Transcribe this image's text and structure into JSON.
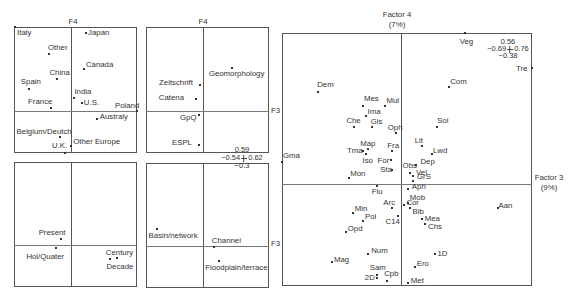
{
  "figure": {
    "f4_label": "F4",
    "f3_label": "F3",
    "factor4_title": "Factor 4",
    "factor4_pct": "(7%)",
    "factor3_title": "Factor 3",
    "factor3_pct": "(9%)",
    "scale_small": {
      "top": "0.59",
      "left": "−0.54",
      "right": "0.62",
      "bottom": "−0.3"
    },
    "scale_large": {
      "top": "0.56",
      "left": "−0.69",
      "right": "0.76",
      "bottom": "−0.38"
    }
  },
  "chart_data": [
    {
      "type": "scatter",
      "xlabel": "F3",
      "ylabel": "F4",
      "xlim": [
        -0.54,
        0.62
      ],
      "ylim": [
        -0.3,
        0.59
      ],
      "grid": false,
      "points": [
        {
          "label": "Italy",
          "x": -0.53,
          "y": 0.59,
          "dx": 2,
          "dy": 6
        },
        {
          "label": "Other",
          "x": -0.21,
          "y": 0.4,
          "dx": -1,
          "dy": -6
        },
        {
          "label": "China",
          "x": -0.13,
          "y": 0.22,
          "dx": -8,
          "dy": -6
        },
        {
          "label": "Spain",
          "x": -0.4,
          "y": 0.15,
          "dx": -8,
          "dy": -7
        },
        {
          "label": "France",
          "x": -0.19,
          "y": 0.02,
          "dx": -23,
          "dy": -6
        },
        {
          "label": "Japan",
          "x": 0.14,
          "y": 0.55,
          "dx": 2,
          "dy": 0
        },
        {
          "label": "Canada",
          "x": 0.12,
          "y": 0.29,
          "dx": 2,
          "dy": -4
        },
        {
          "label": "India",
          "x": 0.03,
          "y": 0.09,
          "dx": 0,
          "dy": -6
        },
        {
          "label": "U.S.",
          "x": 0.1,
          "y": 0.05,
          "dx": 2,
          "dy": 0
        },
        {
          "label": "Poland",
          "x": 0.62,
          "y": 0.0,
          "dx": -22,
          "dy": -5
        },
        {
          "label": "Australy",
          "x": 0.24,
          "y": -0.06,
          "dx": 3,
          "dy": -2
        },
        {
          "label": "Belgium/Deutch",
          "x": -0.11,
          "y": -0.19,
          "dx": -43,
          "dy": -5
        },
        {
          "label": "U.K.",
          "x": -0.06,
          "y": -0.3,
          "dx": -13,
          "dy": -7
        },
        {
          "label": "Other Europe",
          "x": 0.0,
          "y": -0.25,
          "dx": 2,
          "dy": -4
        }
      ]
    },
    {
      "type": "scatter",
      "xlabel": "F3",
      "ylabel": "F4",
      "xlim": [
        -0.54,
        0.62
      ],
      "ylim": [
        -0.3,
        0.59
      ],
      "grid": false,
      "points": [
        {
          "label": "Present",
          "x": -0.1,
          "y": 0.04,
          "dx": -22,
          "dy": -6
        },
        {
          "label": "Hol/Quater",
          "x": -0.14,
          "y": -0.02,
          "dx": -30,
          "dy": 9
        },
        {
          "label": "Century",
          "x": 0.43,
          "y": -0.09,
          "dx": -11,
          "dy": -5
        },
        {
          "label": "Decade",
          "x": 0.37,
          "y": -0.1,
          "dx": -4,
          "dy": 8
        }
      ]
    },
    {
      "type": "scatter",
      "xlabel": "F3",
      "ylabel": "F4",
      "xlim": [
        -0.54,
        0.62
      ],
      "ylim": [
        -0.3,
        0.59
      ],
      "grid": false,
      "points": [
        {
          "label": "Geomorphology",
          "x": 0.27,
          "y": 0.3,
          "dx": -23,
          "dy": 6
        },
        {
          "label": "Zeitschrift",
          "x": -0.03,
          "y": 0.18,
          "dx": -41,
          "dy": -2
        },
        {
          "label": "Catena",
          "x": -0.07,
          "y": 0.08,
          "dx": -37,
          "dy": -1
        },
        {
          "label": "GpQ",
          "x": -0.04,
          "y": -0.03,
          "dx": -19,
          "dy": 3
        },
        {
          "label": "ESPL",
          "x": -0.04,
          "y": -0.24,
          "dx": -27,
          "dy": -2
        }
      ]
    },
    {
      "type": "scatter",
      "xlabel": "F3",
      "ylabel": "F4",
      "xlim": [
        -0.54,
        0.62
      ],
      "ylim": [
        -0.3,
        0.59
      ],
      "grid": false,
      "points": [
        {
          "label": "Basin/network",
          "x": -0.44,
          "y": 0.12,
          "dx": -8,
          "dy": 7
        },
        {
          "label": "Channel",
          "x": 0.1,
          "y": -0.01,
          "dx": -2,
          "dy": -6
        },
        {
          "label": "Floodplain/terrace",
          "x": 0.15,
          "y": -0.11,
          "dx": -14,
          "dy": 7
        }
      ]
    },
    {
      "type": "scatter",
      "xlabel": "Factor 3 (9%)",
      "ylabel": "Factor 4 (7%)",
      "xlim": [
        -0.69,
        0.76
      ],
      "ylim": [
        -0.38,
        0.56
      ],
      "grid": false,
      "points": [
        {
          "label": "Veg",
          "x": 0.37,
          "y": 0.56,
          "dx": -5,
          "dy": 9
        },
        {
          "label": "Tre",
          "x": 0.76,
          "y": 0.43,
          "dx": -16,
          "dy": 1
        },
        {
          "label": "Com",
          "x": 0.28,
          "y": 0.36,
          "dx": 1,
          "dy": -5
        },
        {
          "label": "Soi",
          "x": 0.21,
          "y": 0.21,
          "dx": 0,
          "dy": -6
        },
        {
          "label": "Dem",
          "x": -0.48,
          "y": 0.34,
          "dx": -1,
          "dy": -7
        },
        {
          "label": "Mes",
          "x": -0.22,
          "y": 0.29,
          "dx": 1,
          "dy": -7
        },
        {
          "label": "Mul",
          "x": -0.09,
          "y": 0.29,
          "dx": 1,
          "dy": -5
        },
        {
          "label": "Ima",
          "x": -0.2,
          "y": 0.25,
          "dx": 1,
          "dy": -4
        },
        {
          "label": "Che",
          "x": -0.27,
          "y": 0.21,
          "dx": -8,
          "dy": -6
        },
        {
          "label": "Gis",
          "x": -0.17,
          "y": 0.21,
          "dx": -1,
          "dy": -5
        },
        {
          "label": "Oph",
          "x": -0.03,
          "y": 0.19,
          "dx": -8,
          "dy": -5
        },
        {
          "label": "Map",
          "x": -0.19,
          "y": 0.13,
          "dx": -8,
          "dy": -5
        },
        {
          "label": "Fra",
          "x": -0.05,
          "y": 0.12,
          "dx": -5,
          "dy": -5
        },
        {
          "label": "Tma",
          "x": -0.22,
          "y": 0.12,
          "dx": -16,
          "dy": 0
        },
        {
          "label": "Iso",
          "x": -0.2,
          "y": 0.11,
          "dx": -4,
          "dy": 7
        },
        {
          "label": "For",
          "x": -0.06,
          "y": 0.09,
          "dx": -13,
          "dy": 1
        },
        {
          "label": "Sta",
          "x": -0.05,
          "y": 0.05,
          "dx": -12,
          "dy": 0
        },
        {
          "label": "Gma",
          "x": -0.69,
          "y": 0.08,
          "dx": 1,
          "dy": -6
        },
        {
          "label": "Mon",
          "x": -0.3,
          "y": 0.02,
          "dx": 1,
          "dy": -4
        },
        {
          "label": "Lit",
          "x": 0.12,
          "y": 0.14,
          "dx": -7,
          "dy": -5
        },
        {
          "label": "Lwd",
          "x": 0.18,
          "y": 0.11,
          "dx": 1,
          "dy": -3
        },
        {
          "label": "Obs",
          "x": 0.05,
          "y": 0.04,
          "dx": -7,
          "dy": -7
        },
        {
          "label": "Dep",
          "x": 0.09,
          "y": 0.07,
          "dx": 4,
          "dy": -3
        },
        {
          "label": "Vel",
          "x": 0.07,
          "y": 0.03,
          "dx": 3,
          "dy": -3
        },
        {
          "label": "GrS",
          "x": 0.07,
          "y": 0.01,
          "dx": 4,
          "dy": -4
        },
        {
          "label": "Aph",
          "x": 0.04,
          "y": -0.02,
          "dx": 4,
          "dy": -2
        },
        {
          "label": "Mob",
          "x": 0.04,
          "y": -0.07,
          "dx": 2,
          "dy": -5
        },
        {
          "label": "Cor",
          "x": 0.02,
          "y": -0.08,
          "dx": 2,
          "dy": -2
        },
        {
          "label": "Bib",
          "x": 0.05,
          "y": -0.09,
          "dx": 3,
          "dy": 4
        },
        {
          "label": "Mea",
          "x": 0.12,
          "y": -0.13,
          "dx": 3,
          "dy": 0
        },
        {
          "label": "Chs",
          "x": 0.14,
          "y": -0.15,
          "dx": 3,
          "dy": 3
        },
        {
          "label": "Aan",
          "x": 0.56,
          "y": -0.09,
          "dx": 1,
          "dy": -2
        },
        {
          "label": "Flu",
          "x": -0.14,
          "y": -0.01,
          "dx": -5,
          "dy": 6
        },
        {
          "label": "Arc",
          "x": -0.05,
          "y": -0.09,
          "dx": -9,
          "dy": -5
        },
        {
          "label": "Min",
          "x": -0.28,
          "y": -0.11,
          "dx": 2,
          "dy": -4
        },
        {
          "label": "Pol",
          "x": -0.22,
          "y": -0.14,
          "dx": 2,
          "dy": -4
        },
        {
          "label": "C14",
          "x": -0.02,
          "y": -0.12,
          "dx": -12,
          "dy": 6
        },
        {
          "label": "Opd",
          "x": -0.32,
          "y": -0.18,
          "dx": 2,
          "dy": -3
        },
        {
          "label": "Num",
          "x": -0.19,
          "y": -0.26,
          "dx": 3,
          "dy": -3
        },
        {
          "label": "Mag",
          "x": -0.4,
          "y": -0.29,
          "dx": 2,
          "dy": -2
        },
        {
          "label": "Sam",
          "x": -0.14,
          "y": -0.34,
          "dx": -7,
          "dy": -7
        },
        {
          "label": "2D",
          "x": -0.14,
          "y": -0.35,
          "dx": -12,
          "dy": 0
        },
        {
          "label": "Cpb",
          "x": -0.08,
          "y": -0.36,
          "dx": -3,
          "dy": -7
        },
        {
          "label": "Ero",
          "x": 0.08,
          "y": -0.31,
          "dx": 2,
          "dy": -3
        },
        {
          "label": "1D",
          "x": 0.2,
          "y": -0.26,
          "dx": 2,
          "dy": 0
        },
        {
          "label": "Met",
          "x": 0.04,
          "y": -0.37,
          "dx": 3,
          "dy": -2
        }
      ]
    }
  ]
}
